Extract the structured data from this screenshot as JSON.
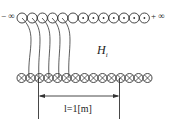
{
  "diagram": {
    "top_row": {
      "left_label": "− ∞",
      "right_label": "+ ∞",
      "conductor_count": 13,
      "current_direction": "out-of-page (dot)"
    },
    "bottom_row": {
      "conductor_count": 15,
      "current_direction": "into-page (cross)"
    },
    "field_label": "H",
    "field_subscript": "i",
    "dimension_label": "l=1[m]",
    "field_line_count": 5,
    "colors": {
      "stroke": "#333333",
      "background": "#ffffff"
    }
  }
}
